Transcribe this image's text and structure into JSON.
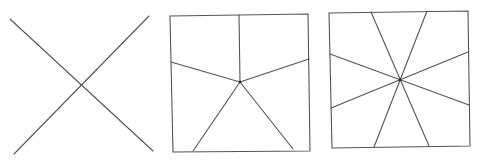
{
  "diagram": {
    "title": "",
    "stroke_color": "#555555",
    "panels": [
      {
        "name": "two-lines-crossing",
        "description": "Two diagonal lines crossing in an X",
        "lines": [
          [
            10,
            19,
            153,
            151
          ],
          [
            14,
            154,
            149,
            16
          ]
        ],
        "center": [
          81,
          86
        ],
        "frame": null
      },
      {
        "name": "square-five-sections",
        "description": "Square divided into 5 regions from an interior point",
        "frame": [
          [
            170,
            16
          ],
          [
            308,
            14
          ],
          [
            310,
            151
          ],
          [
            173,
            152
          ]
        ],
        "center": [
          240,
          82
        ],
        "lines": [
          [
            240,
            82,
            239,
            15
          ],
          [
            240,
            82,
            171,
            62
          ],
          [
            240,
            82,
            309,
            59
          ],
          [
            240,
            82,
            193,
            151
          ],
          [
            240,
            82,
            293,
            149
          ]
        ]
      },
      {
        "name": "square-eight-sections",
        "description": "Square divided into 8 regions by 4 lines through center",
        "frame": [
          [
            329,
            13
          ],
          [
            468,
            11
          ],
          [
            470,
            146
          ],
          [
            332,
            148
          ]
        ],
        "center": [
          400,
          80
        ],
        "lines": [
          [
            371,
            12,
            429,
            146
          ],
          [
            427,
            11,
            374,
            147
          ],
          [
            330,
            54,
            469,
            105
          ],
          [
            468,
            52,
            331,
            108
          ]
        ]
      }
    ]
  }
}
